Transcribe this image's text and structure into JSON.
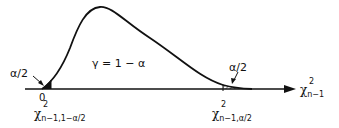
{
  "diagram": {
    "type": "chi-square distribution with two-tailed critical regions",
    "curve_region_label": "γ = 1 − α",
    "left_tail_label": "α/2",
    "right_tail_label": "α/2",
    "origin_label": "0",
    "left_critical_value": {
      "symbol": "χ",
      "superscript": "2",
      "subscript": "n−1,1−α/2"
    },
    "right_critical_value": {
      "symbol": "χ",
      "superscript": "2",
      "subscript": "n−1,α/2"
    },
    "axis_label": {
      "symbol": "χ",
      "superscript": "2",
      "subscript": "n−1"
    },
    "colors": {
      "ink": "#111111",
      "background": "#ffffff"
    }
  }
}
